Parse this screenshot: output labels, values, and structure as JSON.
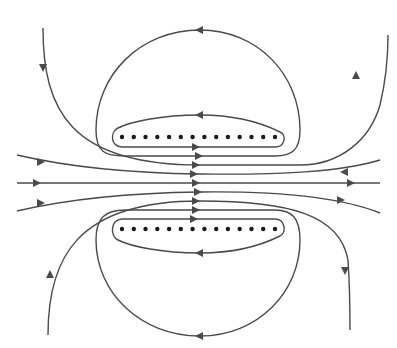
{
  "diagram": {
    "line_color": "#4a4a4a",
    "dot_color": "#1a1a1a",
    "background": "#ffffff",
    "top_row": {
      "dot_count": 14,
      "y": 137,
      "x_start": 122,
      "x_end": 275,
      "symbol": "dot (current out of page)"
    },
    "bottom_row": {
      "dot_count": 14,
      "y": 229,
      "x_start": 122,
      "x_end": 275,
      "symbol": "dot (current out of page)"
    },
    "central_parallel_lines": {
      "count": 9,
      "direction": "left-to-right"
    },
    "loops": [
      {
        "name": "top-inner-loop",
        "direction": "counterclockwise (leftward on top)"
      },
      {
        "name": "top-outer-loop",
        "direction": "counterclockwise (leftward on top)"
      },
      {
        "name": "bottom-inner-loop",
        "direction": "clockwise (leftward on bottom)"
      },
      {
        "name": "bottom-outer-loop",
        "direction": "clockwise (leftward on bottom)"
      }
    ],
    "outer_curves": [
      {
        "name": "upper-left-curve",
        "direction": "down then right"
      },
      {
        "name": "upper-right-curve",
        "direction": "right then up"
      },
      {
        "name": "lower-left-curve",
        "direction": "up then right"
      },
      {
        "name": "lower-right-curve",
        "direction": "right then down"
      }
    ]
  }
}
